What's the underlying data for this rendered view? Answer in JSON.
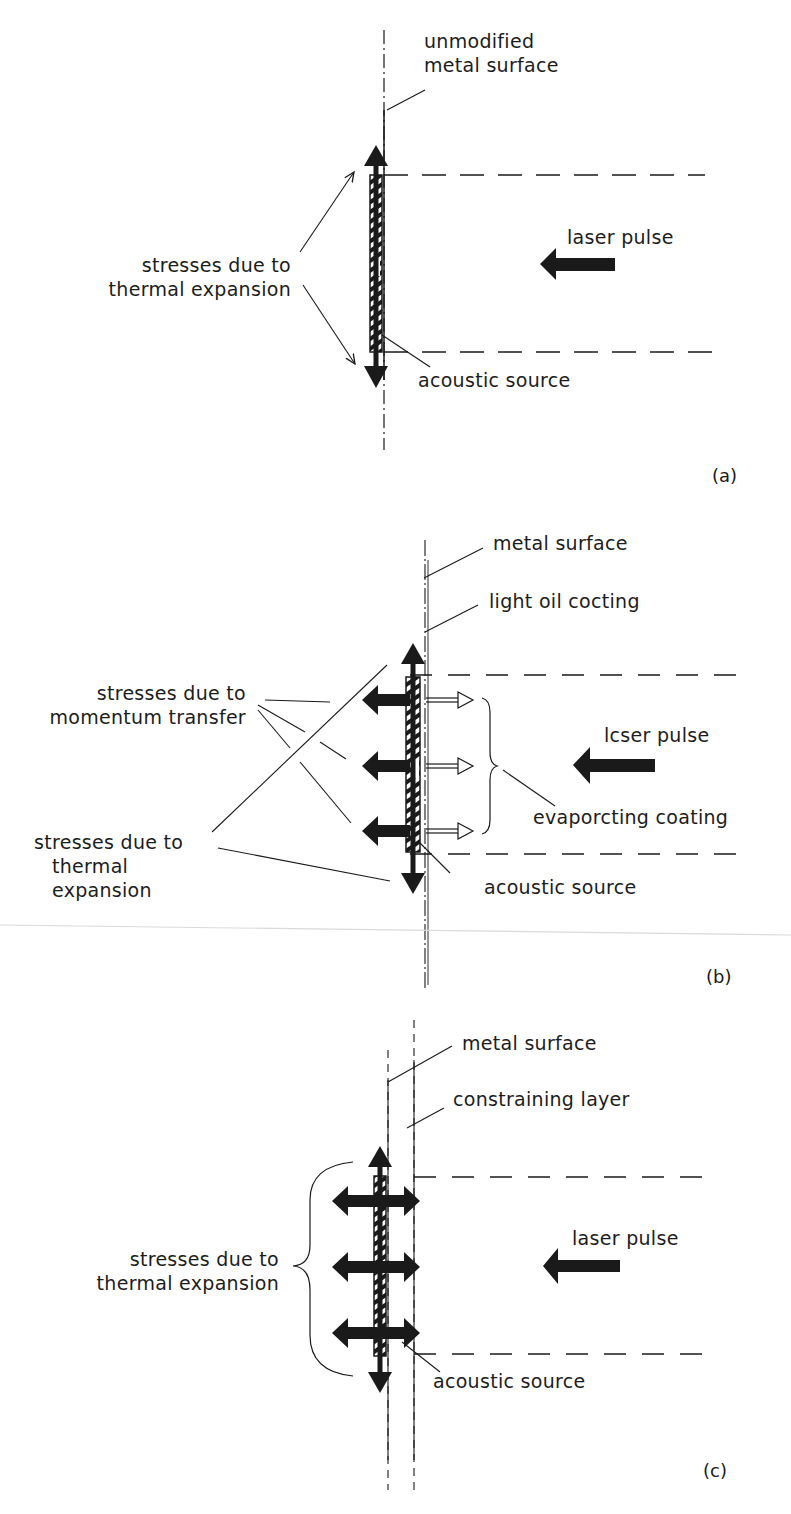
{
  "figure": {
    "panels": [
      {
        "id": "a",
        "tag": "(a)",
        "labels": {
          "surface": [
            "unmodified",
            "metal surface"
          ],
          "stresses": [
            "stresses due to",
            "thermal expansion"
          ],
          "laser": "laser pulse",
          "source": "acoustic source"
        }
      },
      {
        "id": "b",
        "tag": "(b)",
        "labels": {
          "surface": "metal surface",
          "coating": "light oil cocting",
          "momentum": [
            "stresses due to",
            "momentum transfer"
          ],
          "thermal": [
            "stresses due to",
            "thermal",
            "expansion"
          ],
          "laser": "lcser pulse",
          "evaporating": "evaporcting  coating",
          "source": "acoustic source"
        }
      },
      {
        "id": "c",
        "tag": "(c)",
        "labels": {
          "surface": "metal surface",
          "layer": "constraining layer",
          "stresses": [
            "stresses due to",
            "thermal expansion"
          ],
          "laser": "laser pulse",
          "source": "acoustic source"
        }
      }
    ],
    "colors": {
      "ink": "#1a1a1a",
      "paper": "#ffffff"
    }
  }
}
